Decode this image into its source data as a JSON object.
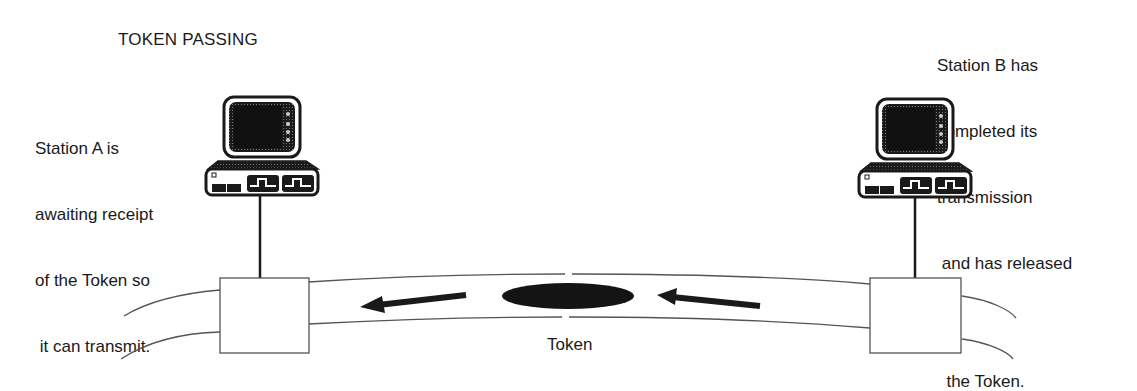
{
  "title": "TOKEN PASSING",
  "stations": [
    {
      "id": "A",
      "description_lines": [
        "Station A is",
        "awaiting receipt",
        "of the Token so",
        " it can transmit."
      ]
    },
    {
      "id": "B",
      "description_lines": [
        "Station B has",
        "completed its",
        "transmission",
        " and has released",
        "",
        "  the Token."
      ]
    }
  ],
  "token": {
    "label": "Token"
  },
  "colors": {
    "ink": "#1a1a1a",
    "background": "#ffffff",
    "ring": "#555555"
  }
}
